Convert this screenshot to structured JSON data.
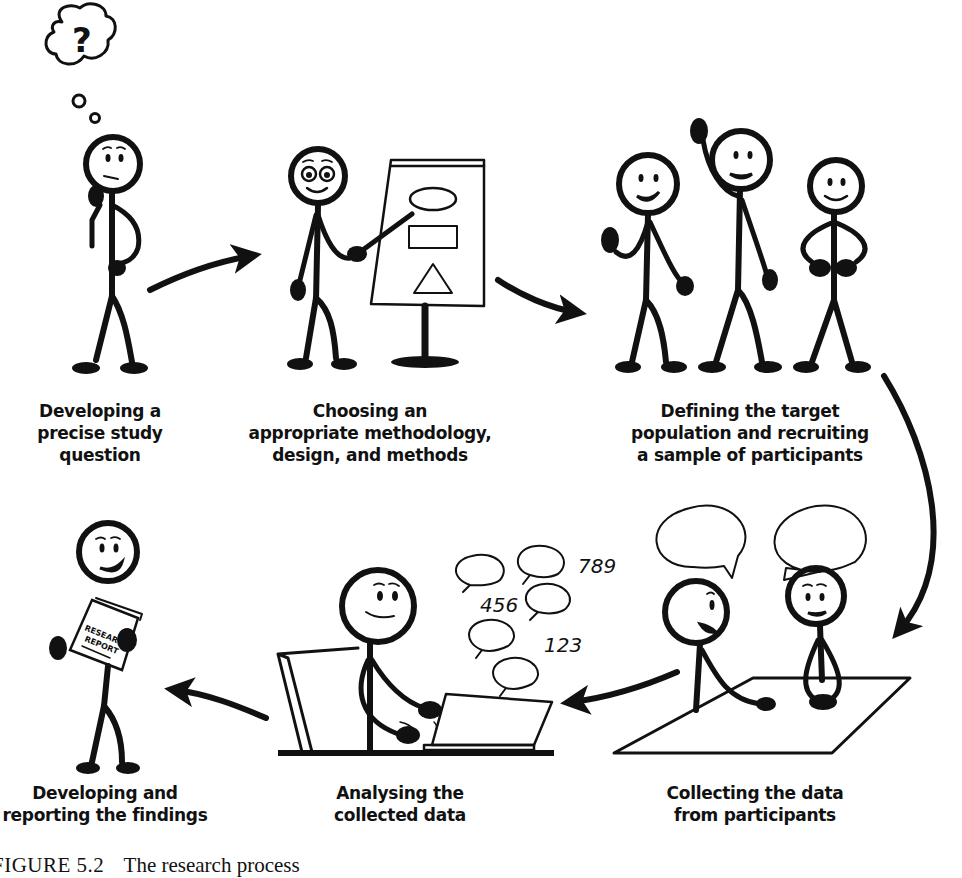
{
  "figure": {
    "caption_number": "FIGURE 5.2",
    "caption_title": "The research process",
    "theme_color": "#111111",
    "background": "#ffffff"
  },
  "steps": [
    {
      "id": 1,
      "label": "Developing a\nprecise study\nquestion",
      "scene": "thinking-person-with-question-mark"
    },
    {
      "id": 2,
      "label": "Choosing an\nappropriate methodology,\ndesign, and methods",
      "scene": "presenter-pointing-at-flipchart"
    },
    {
      "id": 3,
      "label": "Defining the target\npopulation and recruiting\na sample of participants",
      "scene": "three-participants"
    },
    {
      "id": 4,
      "label": "Collecting the data\nfrom participants",
      "scene": "two-people-talking-at-table"
    },
    {
      "id": 5,
      "label": "Analysing the\ncollected data",
      "scene": "person-at-laptop-with-data-bubbles"
    },
    {
      "id": 6,
      "label": "Developing and\nreporting the findings",
      "scene": "person-holding-report"
    }
  ],
  "scene_text": {
    "thought_symbol": "?",
    "data_numbers": [
      "789",
      "456",
      "123"
    ],
    "report_line1": "RESEARCH",
    "report_line2": "REPORT"
  },
  "flow": [
    "step1->step2",
    "step2->step3",
    "step3->step4",
    "step4->step5",
    "step5->step6"
  ]
}
